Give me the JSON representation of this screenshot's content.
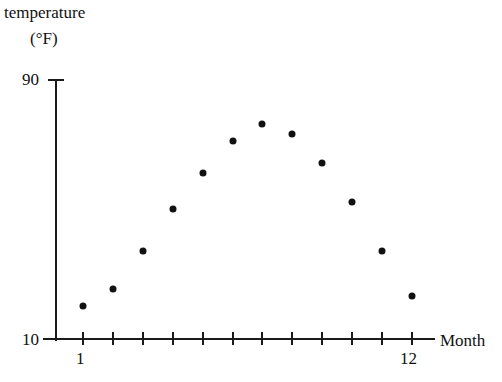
{
  "chart_data": {
    "type": "scatter",
    "title": "",
    "ylabel": "temperature (°F)",
    "ylabel_line1": "temperature",
    "ylabel_line2": "(°F)",
    "xlabel": "Month",
    "x": [
      1,
      2,
      3,
      4,
      5,
      6,
      7,
      8,
      9,
      10,
      11,
      12
    ],
    "values": [
      20,
      25,
      37,
      50,
      61,
      71,
      76,
      73,
      64,
      52,
      37,
      23
    ],
    "categories": [
      "1",
      "2",
      "3",
      "4",
      "5",
      "6",
      "7",
      "8",
      "9",
      "10",
      "11",
      "12"
    ],
    "xlim": [
      0,
      13
    ],
    "ylim": [
      10,
      90
    ],
    "x_tick_labels": [
      "1",
      "12"
    ],
    "x_tick_label_values": [
      1,
      12
    ],
    "y_tick_labels": [
      "10",
      "90"
    ],
    "y_tick_label_values": [
      10,
      90
    ],
    "x_tick_count": 12,
    "grid": false,
    "legend": false,
    "marker_color": "#111111",
    "axis_color": "#1a1a1a",
    "background_color": "#ffffff",
    "points": [
      {
        "month": 1,
        "temperature": 20
      },
      {
        "month": 2,
        "temperature": 25
      },
      {
        "month": 3,
        "temperature": 37
      },
      {
        "month": 4,
        "temperature": 50
      },
      {
        "month": 5,
        "temperature": 61
      },
      {
        "month": 6,
        "temperature": 71
      },
      {
        "month": 7,
        "temperature": 76
      },
      {
        "month": 8,
        "temperature": 73
      },
      {
        "month": 9,
        "temperature": 64
      },
      {
        "month": 10,
        "temperature": 52
      },
      {
        "month": 11,
        "temperature": 37
      },
      {
        "month": 12,
        "temperature": 23
      }
    ]
  },
  "axes": {
    "y_label_line1": "temperature",
    "y_label_line2": "(°F)",
    "x_label": "Month",
    "y_top_tick": "90",
    "y_bottom_tick": "10",
    "x_first_tick": "1",
    "x_last_tick": "12"
  }
}
